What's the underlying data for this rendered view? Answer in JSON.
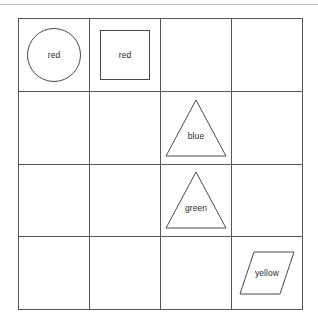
{
  "canvas": {
    "width": 318,
    "height": 328,
    "background": "#ffffff",
    "rule_color": "#b9b9b9"
  },
  "grid": {
    "rows": 4,
    "columns": 4,
    "line_color": "#555555",
    "shape_line_color": "#4a4a4a",
    "label_color": "#2b2b2b"
  },
  "shapes": [
    {
      "id": "circle-red",
      "kind": "circle",
      "label": "red",
      "row": 1,
      "column": 1
    },
    {
      "id": "square-red",
      "kind": "square",
      "label": "red",
      "row": 1,
      "column": 2
    },
    {
      "id": "triangle-blue",
      "kind": "triangle",
      "label": "blue",
      "row": 2,
      "column": 3
    },
    {
      "id": "triangle-green",
      "kind": "triangle",
      "label": "green",
      "row": 3,
      "column": 3
    },
    {
      "id": "parallelogram-yellow",
      "kind": "parallelogram",
      "label": "yellow",
      "row": 4,
      "column": 4
    }
  ]
}
